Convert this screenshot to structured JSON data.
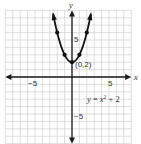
{
  "chart_data": {
    "type": "line",
    "title": "",
    "equation_label": "y = x² + 2",
    "equation_parts": {
      "lhs": "y",
      "eq": " = ",
      "var": "x",
      "exp": "2",
      "rest": " + 2"
    },
    "xlabel": "x",
    "ylabel": "y",
    "xlim": [
      -9,
      8
    ],
    "ylim": [
      -9,
      9
    ],
    "grid": true,
    "x_tick_labels": [
      {
        "value": -5,
        "label": "−5"
      },
      {
        "value": 5,
        "label": "5"
      }
    ],
    "y_tick_labels": [
      {
        "value": 5,
        "label": "5"
      },
      {
        "value": -5,
        "label": "−5"
      }
    ],
    "series": [
      {
        "name": "y = x^2 + 2",
        "x": [
          -2,
          -1,
          0,
          1,
          2
        ],
        "y": [
          6,
          3,
          2,
          3,
          6
        ],
        "marked_points": [
          [
            -2,
            6
          ],
          [
            -1,
            3
          ],
          [
            0,
            2
          ],
          [
            1,
            3
          ],
          [
            2,
            6
          ]
        ],
        "arrows_at_ends": true
      }
    ],
    "annotations": [
      {
        "x": 0,
        "y": 2,
        "text": "(0,2)"
      }
    ]
  },
  "colors": {
    "grid": "#c8c8c8",
    "axis": "#1a1a1a",
    "curve": "#111111",
    "text": "#333333"
  }
}
